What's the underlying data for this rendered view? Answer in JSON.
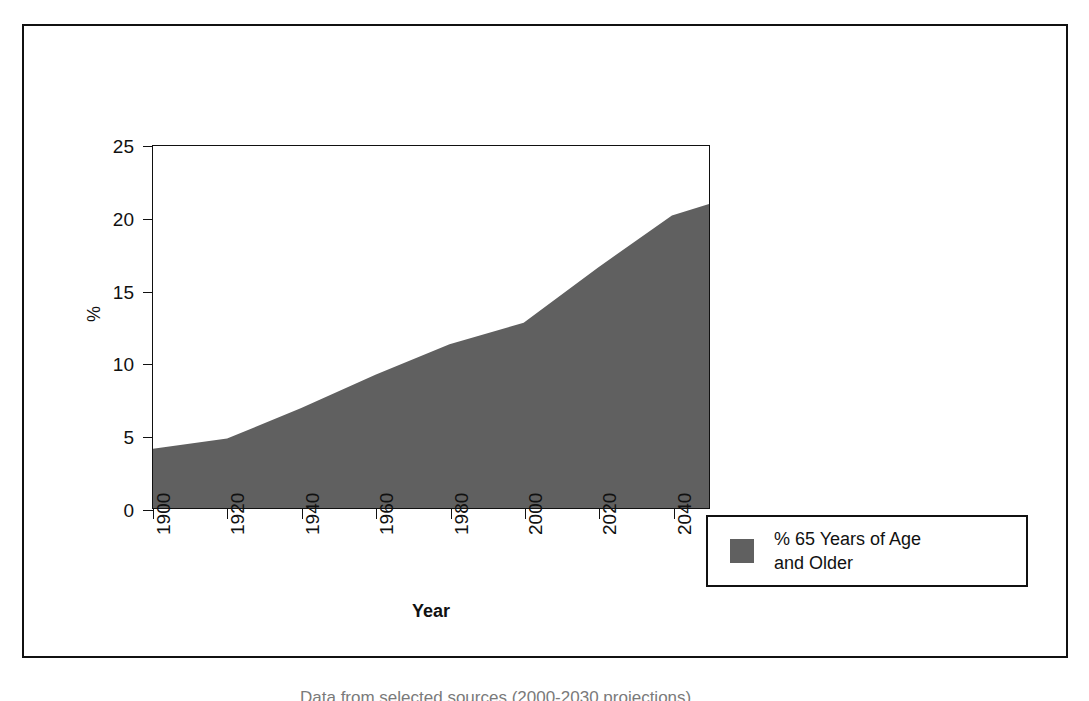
{
  "chart_data": {
    "type": "area",
    "title": "",
    "xlabel": "Year",
    "ylabel": "%",
    "xlim": [
      1900,
      2050
    ],
    "ylim": [
      0,
      25
    ],
    "grid": false,
    "legend_position": "right-bottom-outside",
    "series_color": "#606060",
    "x": [
      1900,
      1920,
      1940,
      1960,
      1980,
      2000,
      2020,
      2040,
      2050
    ],
    "series": [
      {
        "name": "% 65 Years of Age and Older",
        "values": [
          4.1,
          4.8,
          6.9,
          9.2,
          11.3,
          12.8,
          16.6,
          20.2,
          21.0
        ]
      }
    ],
    "x_ticks": [
      1900,
      1920,
      1940,
      1960,
      1980,
      2000,
      2020,
      2040
    ],
    "y_ticks": [
      0,
      5,
      10,
      15,
      20,
      25
    ],
    "x_tick_labels": [
      "1900",
      "1920",
      "1940",
      "1960",
      "1980",
      "2000",
      "2020",
      "2040"
    ],
    "y_tick_labels": [
      "0",
      "5",
      "10",
      "15",
      "20",
      "25"
    ]
  },
  "axes": {
    "y_title": "%",
    "x_title": "Year"
  },
  "legend": {
    "entries": [
      {
        "label_line1": "% 65 Years of Age",
        "label_line2": "and Older",
        "swatch_color": "#606060",
        "swatch_icon": "square-swatch-icon"
      }
    ]
  },
  "caption": {
    "clipped_text": "Data from selected sources (2000-2030 projections)"
  }
}
